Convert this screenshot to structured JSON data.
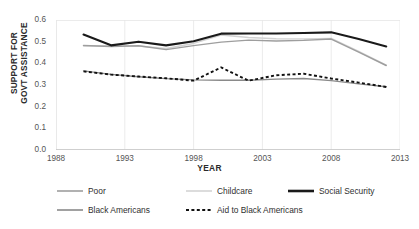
{
  "chart_data": {
    "type": "line",
    "title": "",
    "xlabel": "YEAR",
    "ylabel": "SUPPORT FOR\nGOVT ASSISTANCE",
    "xlim": [
      1988,
      2013
    ],
    "ylim": [
      0.0,
      0.6
    ],
    "xticks": [
      "1988",
      "1993",
      "1998",
      "2003",
      "2008",
      "2013"
    ],
    "xtick_values": [
      1988,
      1993,
      1998,
      2003,
      2008,
      2013
    ],
    "yticks": [
      "0.0",
      "0.1",
      "0.2",
      "0.3",
      "0.4",
      "0.5",
      "0.6"
    ],
    "ytick_values": [
      0.0,
      0.1,
      0.2,
      0.3,
      0.4,
      0.5,
      0.6
    ],
    "grid": "vertical-only",
    "legend_position": "bottom",
    "x": [
      1990,
      1992,
      1994,
      1996,
      1998,
      2000,
      2002,
      2004,
      2006,
      2008,
      2010,
      2012
    ],
    "series": [
      {
        "name": "Social Security",
        "color": "#1a1a1a",
        "width": 2.1,
        "dash": "none",
        "values": [
          0.533,
          0.483,
          0.5,
          0.483,
          0.502,
          0.537,
          0.538,
          0.538,
          0.54,
          0.543,
          0.512,
          0.478
        ]
      },
      {
        "name": "Childcare",
        "color": "#d2d2d2",
        "width": 1.5,
        "dash": "none",
        "values": [
          0.481,
          0.48,
          0.48,
          0.468,
          0.492,
          0.531,
          0.519,
          0.514,
          0.512,
          0.515,
          0.455,
          0.392
        ]
      },
      {
        "name": "Poor",
        "color": "#9e9e9e",
        "width": 1.4,
        "dash": "none",
        "values": [
          0.482,
          0.478,
          0.481,
          0.463,
          0.482,
          0.498,
          0.507,
          0.503,
          0.506,
          0.512,
          0.452,
          0.39
        ]
      },
      {
        "name": "Black Americans",
        "color": "#8a8a8a",
        "width": 1.3,
        "dash": "none",
        "values": [
          0.365,
          0.349,
          0.338,
          0.329,
          0.324,
          0.322,
          0.322,
          0.327,
          0.33,
          0.32,
          0.305,
          0.292
        ]
      },
      {
        "name": "Aid to Black Americans",
        "color": "#111111",
        "width": 1.9,
        "dash": "3 2.4",
        "values": [
          0.363,
          0.348,
          0.339,
          0.331,
          0.32,
          0.381,
          0.32,
          0.345,
          0.352,
          0.33,
          0.311,
          0.291
        ]
      }
    ]
  },
  "legend": {
    "items": [
      {
        "label": "Poor",
        "color": "#9e9e9e",
        "width": 1.6,
        "dash": "none"
      },
      {
        "label": "Childcare",
        "color": "#d4d4d4",
        "width": 1.6,
        "dash": "none"
      },
      {
        "label": "Social Security",
        "color": "#1a1a1a",
        "width": 2.6,
        "dash": "none"
      },
      {
        "label": "Black Americans",
        "color": "#8a8a8a",
        "width": 1.6,
        "dash": "none"
      },
      {
        "label": "Aid to Black Americans",
        "color": "#111111",
        "width": 2.0,
        "dash": "3 2.4"
      }
    ]
  },
  "colors": {
    "axis": "#c9c9c9",
    "grid": "#e6e6e6",
    "tick_text": "#555555",
    "title_text": "#2b2b2b",
    "background": "#ffffff"
  }
}
